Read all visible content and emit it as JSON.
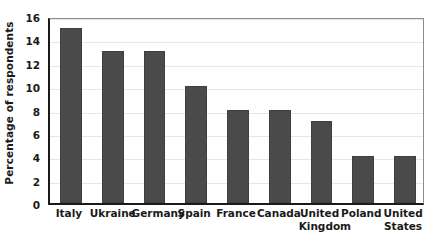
{
  "chart_data": {
    "type": "bar",
    "title": "",
    "xlabel": "",
    "ylabel": "Percentage of respondents",
    "categories": [
      "Italy",
      "Ukraine",
      "Germany",
      "Spain",
      "France",
      "Canada",
      "United Kingdom",
      "Poland",
      "United States"
    ],
    "values": [
      15,
      13,
      13,
      10,
      8,
      8,
      7,
      4,
      4
    ],
    "ylim": [
      0,
      16
    ],
    "ytick_labels": [
      "0",
      "2",
      "4",
      "6",
      "8",
      "10",
      "12",
      "14",
      "16"
    ],
    "ytick_values": [
      0,
      2,
      4,
      6,
      8,
      10,
      12,
      14,
      16
    ],
    "grid": true,
    "legend": "none",
    "bar_color": "#4a4a4a",
    "gridline_color": "#e6e6e6",
    "axis_color": "#1a1a1a",
    "plot_border_color": "#8c8c8c",
    "background_color": "#ffffff"
  }
}
